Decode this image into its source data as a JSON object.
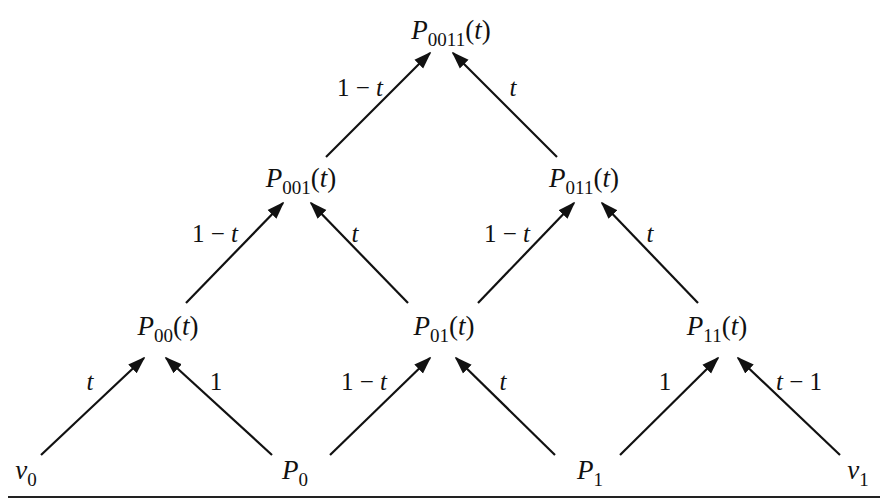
{
  "diagram": {
    "type": "recursive-evaluation-pyramid",
    "nodes": [
      {
        "id": "P0011",
        "letter": "P",
        "sub": "0011",
        "arg": "(t)"
      },
      {
        "id": "P001",
        "letter": "P",
        "sub": "001",
        "arg": "(t)"
      },
      {
        "id": "P011",
        "letter": "P",
        "sub": "011",
        "arg": "(t)"
      },
      {
        "id": "P00",
        "letter": "P",
        "sub": "00",
        "arg": "(t)"
      },
      {
        "id": "P01",
        "letter": "P",
        "sub": "01",
        "arg": "(t)"
      },
      {
        "id": "P11",
        "letter": "P",
        "sub": "11",
        "arg": "(t)"
      },
      {
        "id": "v0",
        "letter": "v",
        "sub": "0",
        "arg": ""
      },
      {
        "id": "P0",
        "letter": "P",
        "sub": "0",
        "arg": ""
      },
      {
        "id": "P1",
        "letter": "P",
        "sub": "1",
        "arg": ""
      },
      {
        "id": "v1",
        "letter": "v",
        "sub": "1",
        "arg": ""
      }
    ],
    "edges": [
      {
        "from": "P001",
        "to": "P0011",
        "label": "1 − t"
      },
      {
        "from": "P011",
        "to": "P0011",
        "label": "t"
      },
      {
        "from": "P00",
        "to": "P001",
        "label": "1 − t"
      },
      {
        "from": "P01",
        "to": "P001",
        "label": "t"
      },
      {
        "from": "P01",
        "to": "P011",
        "label": "1 − t"
      },
      {
        "from": "P11",
        "to": "P011",
        "label": "t"
      },
      {
        "from": "v0",
        "to": "P00",
        "label": "t"
      },
      {
        "from": "P0",
        "to": "P00",
        "label": "1"
      },
      {
        "from": "P0",
        "to": "P01",
        "label": "1 − t"
      },
      {
        "from": "P1",
        "to": "P01",
        "label": "t"
      },
      {
        "from": "P1",
        "to": "P11",
        "label": "1"
      },
      {
        "from": "v1",
        "to": "P11",
        "label": "t − 1"
      }
    ]
  }
}
